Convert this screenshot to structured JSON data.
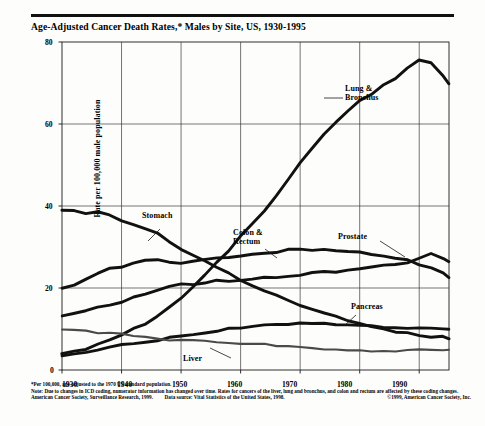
{
  "chart_data": {
    "type": "line",
    "title": "Age-Adjusted Cancer Death Rates,* Males by Site, US, 1930-1995",
    "xlabel": "",
    "ylabel": "Rate per 100,000 male population",
    "xlim": [
      1930,
      1995
    ],
    "ylim": [
      0,
      80
    ],
    "yticks": [
      0,
      20,
      40,
      60,
      80
    ],
    "xticks": [
      1930,
      1940,
      1950,
      1960,
      1970,
      1980,
      1990
    ],
    "grid": true,
    "legend_position": "inline-annotations",
    "x": [
      1930,
      1932,
      1934,
      1936,
      1938,
      1940,
      1942,
      1944,
      1946,
      1948,
      1950,
      1952,
      1954,
      1956,
      1958,
      1960,
      1962,
      1964,
      1966,
      1968,
      1970,
      1972,
      1974,
      1976,
      1978,
      1980,
      1982,
      1984,
      1986,
      1988,
      1990,
      1992,
      1994,
      1995
    ],
    "series": [
      {
        "name": "Lung & Bronchus",
        "values": [
          4.0,
          4.6,
          5.2,
          6.2,
          7.2,
          8.6,
          10.0,
          11.4,
          13.2,
          15.2,
          17.6,
          20.4,
          23.2,
          26.2,
          29.2,
          32.6,
          35.6,
          39.0,
          42.6,
          46.6,
          50.4,
          54.0,
          57.4,
          60.6,
          63.2,
          65.6,
          67.4,
          69.6,
          71.2,
          73.6,
          75.8,
          75.0,
          71.6,
          70.0
        ]
      },
      {
        "name": "Stomach",
        "values": [
          39.0,
          38.8,
          38.2,
          38.6,
          37.8,
          36.2,
          35.6,
          34.4,
          33.2,
          31.4,
          29.6,
          28.2,
          26.4,
          25.0,
          23.6,
          22.0,
          20.6,
          19.4,
          18.2,
          17.0,
          15.8,
          14.8,
          13.8,
          13.0,
          12.2,
          11.4,
          10.6,
          10.0,
          9.4,
          9.0,
          8.6,
          8.2,
          8.0,
          7.8
        ]
      },
      {
        "name": "Colon & Rectum",
        "values": [
          20.0,
          20.8,
          22.0,
          23.6,
          24.6,
          25.2,
          26.2,
          26.6,
          26.8,
          26.2,
          26.0,
          26.4,
          26.8,
          27.2,
          27.6,
          28.0,
          28.2,
          28.4,
          28.8,
          29.4,
          29.4,
          29.2,
          29.4,
          29.2,
          29.0,
          28.8,
          28.4,
          28.0,
          27.4,
          26.8,
          25.8,
          25.0,
          23.6,
          22.4
        ]
      },
      {
        "name": "Prostate",
        "values": [
          13.2,
          13.8,
          14.4,
          15.2,
          16.0,
          16.6,
          17.6,
          18.4,
          19.4,
          20.4,
          20.8,
          21.0,
          21.4,
          21.8,
          21.6,
          21.8,
          22.2,
          22.4,
          22.6,
          22.8,
          23.2,
          23.6,
          23.8,
          24.0,
          24.4,
          24.6,
          25.0,
          25.4,
          25.8,
          26.2,
          27.4,
          28.2,
          27.0,
          26.4
        ]
      },
      {
        "name": "Pancreas",
        "values": [
          3.6,
          4.0,
          4.4,
          4.8,
          5.4,
          6.0,
          6.4,
          6.8,
          7.2,
          7.8,
          8.4,
          8.8,
          9.2,
          9.6,
          10.0,
          10.4,
          10.6,
          10.8,
          11.0,
          11.2,
          11.4,
          11.4,
          11.4,
          11.2,
          11.2,
          11.0,
          10.8,
          10.6,
          10.4,
          10.2,
          10.2,
          10.0,
          10.0,
          10.0
        ]
      },
      {
        "name": "Liver",
        "values": [
          10.0,
          9.8,
          9.6,
          9.2,
          9.0,
          8.8,
          8.4,
          8.0,
          7.6,
          7.4,
          7.2,
          7.2,
          7.2,
          7.0,
          6.8,
          6.6,
          6.4,
          6.2,
          6.0,
          5.8,
          5.6,
          5.4,
          5.2,
          5.0,
          4.8,
          4.6,
          4.6,
          4.6,
          4.6,
          4.8,
          4.8,
          5.0,
          5.0,
          5.0
        ]
      }
    ],
    "annotations": [
      {
        "label": "Lung &\nBronchus",
        "line1": "Lung &",
        "line2": "Bronchus"
      },
      {
        "label": "Stomach"
      },
      {
        "label": "Colon &\nRectum",
        "line1": "Colon &",
        "line2": "Rectum"
      },
      {
        "label": "Prostate"
      },
      {
        "label": "Pancreas"
      },
      {
        "label": "Liver"
      }
    ]
  },
  "labels": {
    "lung_l1": "Lung &",
    "lung_l2": "Bronchus",
    "stomach": "Stomach",
    "colon_l1": "Colon &",
    "colon_l2": "Rectum",
    "prostate": "Prostate",
    "pancreas": "Pancreas",
    "liver": "Liver"
  },
  "axis": {
    "ylabel": "Rate per 100,000 male population",
    "y": [
      "80",
      "60",
      "40",
      "20",
      "0"
    ],
    "x": [
      "1930",
      "1940",
      "1950",
      "1960",
      "1970",
      "1980",
      "1990"
    ]
  },
  "footnotes": {
    "star": "*Per 100,000, age-adjusted to the 1970 US standard population.",
    "note": "Note: Due to changes in ICD coding, numerator information has changed over time. Rates for cancers of the liver, lung and bronchus, and colon and rectum are affected by these coding changes.",
    "source_left": "American Cancer Society, Surveillance Research, 1999.",
    "source_mid": "Data source: Vital Statistics of the United States, 1998.",
    "copyright": "©1999, American Cancer Society, Inc."
  }
}
